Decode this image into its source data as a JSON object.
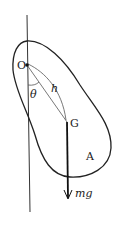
{
  "diagram": {
    "labels": {
      "pivot": "O",
      "center_of_mass": "G",
      "angle": "θ",
      "distance": "h",
      "body": "A",
      "weight": "mg"
    },
    "colors": {
      "stroke": "#222222",
      "background": "#ffffff"
    }
  }
}
